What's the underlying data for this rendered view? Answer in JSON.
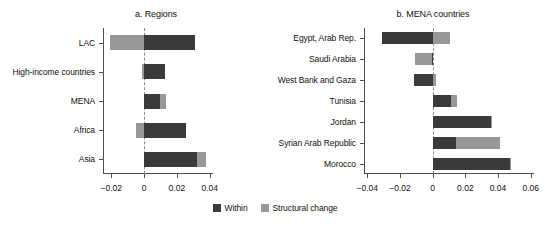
{
  "legend": {
    "items": [
      {
        "label": "Within",
        "color": "#3a3a3a",
        "key": "within"
      },
      {
        "label": "Structural change",
        "color": "#989898",
        "key": "structural"
      }
    ]
  },
  "chart_data": [
    {
      "type": "bar",
      "orientation": "horizontal",
      "stacked": true,
      "title": "a. Regions",
      "xlabel": "",
      "ylabel": "",
      "xlim": [
        -0.025,
        0.042
      ],
      "xticks": [
        -0.02,
        0,
        0.02,
        0.04
      ],
      "xticklabels": [
        "−0.02",
        "0",
        "0.02",
        "0.04"
      ],
      "grid": false,
      "zero_reference_line": true,
      "legend_position": "bottom-center",
      "categories": [
        "LAC",
        "High-income countries",
        "MENA",
        "Africa",
        "Asia"
      ],
      "series": [
        {
          "name": "Within",
          "color": "#3a3a3a",
          "values": [
            0.031,
            0.0125,
            0.0095,
            0.0255,
            0.0325
          ]
        },
        {
          "name": "Structural change",
          "color": "#989898",
          "values": [
            -0.021,
            -0.0012,
            0.004,
            -0.0052,
            0.005
          ]
        }
      ]
    },
    {
      "type": "bar",
      "orientation": "horizontal",
      "stacked": true,
      "title": "b. MENA countries",
      "xlabel": "",
      "ylabel": "",
      "xlim": [
        -0.042,
        0.062
      ],
      "xticks": [
        -0.04,
        -0.02,
        0,
        0.02,
        0.04,
        0.06
      ],
      "xticklabels": [
        "−0.04",
        "−0.02",
        "0",
        "0.02",
        "0.04",
        "0.06"
      ],
      "grid": false,
      "zero_reference_line": true,
      "legend_position": "bottom-center",
      "categories": [
        "Egypt, Arab Rep.",
        "Saudi Arabia",
        "West Bank and Gaza",
        "Tunisia",
        "Jordan",
        "Syrian Arab Republic",
        "Morocco"
      ],
      "series": [
        {
          "name": "Within",
          "color": "#3a3a3a",
          "values": [
            -0.031,
            -0.0005,
            -0.0115,
            0.0112,
            0.0355,
            0.014,
            0.0475
          ]
        },
        {
          "name": "Structural change",
          "color": "#989898",
          "values": [
            0.0108,
            -0.0105,
            0.0022,
            0.0034,
            0.0005,
            0.0272,
            0.0005
          ]
        }
      ]
    }
  ]
}
